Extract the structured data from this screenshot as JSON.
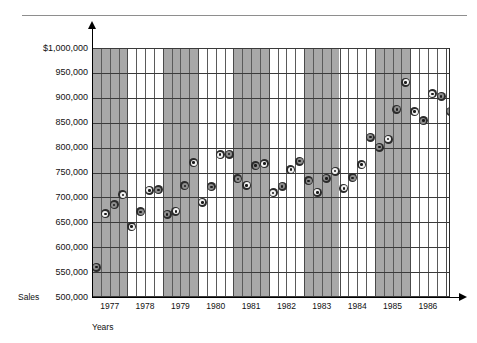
{
  "chart_data": {
    "type": "scatter",
    "title": "",
    "xlabel": "Years",
    "ylabel": "Sales",
    "ylim": [
      500000,
      1000000
    ],
    "grid": true,
    "legend": "none",
    "y_ticks": [
      "$1,000,000",
      "950,000",
      "900,000",
      "850,000",
      "800,000",
      "750,000",
      "700,000",
      "650,000",
      "600,000",
      "550,000",
      "500,000"
    ],
    "y_tick_values": [
      1000000,
      950000,
      900000,
      850000,
      800000,
      750000,
      700000,
      650000,
      600000,
      550000,
      500000
    ],
    "x_ticks": [
      "1977",
      "1978",
      "1979",
      "1980",
      "1981",
      "1982",
      "1983",
      "1984",
      "1985",
      "1986"
    ],
    "x_unit": "quarter",
    "shaded_years": [
      "1977",
      "1979",
      "1981",
      "1983",
      "1985"
    ],
    "points": [
      {
        "year": 1977,
        "quarter": 1,
        "value": 560000,
        "clipped": true
      },
      {
        "year": 1977,
        "quarter": 2,
        "value": 667000
      },
      {
        "year": 1977,
        "quarter": 3,
        "value": 685000
      },
      {
        "year": 1977,
        "quarter": 4,
        "value": 705000
      },
      {
        "year": 1978,
        "quarter": 1,
        "value": 641000
      },
      {
        "year": 1978,
        "quarter": 2,
        "value": 671000
      },
      {
        "year": 1978,
        "quarter": 3,
        "value": 714000
      },
      {
        "year": 1978,
        "quarter": 4,
        "value": 715000
      },
      {
        "year": 1979,
        "quarter": 1,
        "value": 666000
      },
      {
        "year": 1979,
        "quarter": 2,
        "value": 672000
      },
      {
        "year": 1979,
        "quarter": 3,
        "value": 723000
      },
      {
        "year": 1979,
        "quarter": 4,
        "value": 770000
      },
      {
        "year": 1980,
        "quarter": 1,
        "value": 690000
      },
      {
        "year": 1980,
        "quarter": 2,
        "value": 721000
      },
      {
        "year": 1980,
        "quarter": 3,
        "value": 786000
      },
      {
        "year": 1980,
        "quarter": 4,
        "value": 787000
      },
      {
        "year": 1981,
        "quarter": 1,
        "value": 737000
      },
      {
        "year": 1981,
        "quarter": 2,
        "value": 724000
      },
      {
        "year": 1981,
        "quarter": 3,
        "value": 764000
      },
      {
        "year": 1981,
        "quarter": 4,
        "value": 768000
      },
      {
        "year": 1982,
        "quarter": 1,
        "value": 709000
      },
      {
        "year": 1982,
        "quarter": 2,
        "value": 722000
      },
      {
        "year": 1982,
        "quarter": 3,
        "value": 756000
      },
      {
        "year": 1982,
        "quarter": 4,
        "value": 773000
      },
      {
        "year": 1983,
        "quarter": 1,
        "value": 733000
      },
      {
        "year": 1983,
        "quarter": 2,
        "value": 710000
      },
      {
        "year": 1983,
        "quarter": 3,
        "value": 738000
      },
      {
        "year": 1983,
        "quarter": 4,
        "value": 753000
      },
      {
        "year": 1984,
        "quarter": 1,
        "value": 718000
      },
      {
        "year": 1984,
        "quarter": 2,
        "value": 739000
      },
      {
        "year": 1984,
        "quarter": 3,
        "value": 766000
      },
      {
        "year": 1984,
        "quarter": 4,
        "value": 821000
      },
      {
        "year": 1985,
        "quarter": 1,
        "value": 801000
      },
      {
        "year": 1985,
        "quarter": 2,
        "value": 817000
      },
      {
        "year": 1985,
        "quarter": 3,
        "value": 877000
      },
      {
        "year": 1985,
        "quarter": 4,
        "value": 931000
      },
      {
        "year": 1986,
        "quarter": 1,
        "value": 872000
      },
      {
        "year": 1986,
        "quarter": 2,
        "value": 854000
      },
      {
        "year": 1986,
        "quarter": 3,
        "value": 908000
      },
      {
        "year": 1986,
        "quarter": 4,
        "value": 903000
      },
      {
        "year": 1987,
        "quarter": 1,
        "value": 873000,
        "clipped": true
      }
    ]
  },
  "labels": {
    "sales": "Sales",
    "years": "Years"
  }
}
